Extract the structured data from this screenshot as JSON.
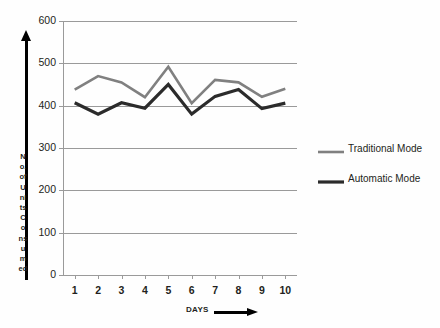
{
  "chart_data": {
    "type": "line",
    "title": "",
    "xlabel": "DAYS",
    "ylabel": "No. of Units Consumed",
    "ylabel_stack": [
      "N",
      "o.",
      "of",
      "U",
      "ni",
      "ts",
      "C",
      "o",
      "ns",
      "u",
      "m",
      "ed"
    ],
    "categories": [
      "1",
      "2",
      "3",
      "4",
      "5",
      "6",
      "7",
      "8",
      "9",
      "10"
    ],
    "x": [
      1,
      2,
      3,
      4,
      5,
      6,
      7,
      8,
      9,
      10
    ],
    "ylim": [
      0,
      600
    ],
    "yticks": [
      0,
      100,
      200,
      300,
      400,
      500,
      600
    ],
    "grid": true,
    "legend_position": "right",
    "series": [
      {
        "name": "Traditional Mode",
        "color": "#808080",
        "values": [
          438,
          470,
          455,
          420,
          492,
          406,
          461,
          455,
          421,
          440
        ]
      },
      {
        "name": "Automatic Mode",
        "color": "#2b2b2b",
        "values": [
          407,
          380,
          407,
          394,
          450,
          380,
          422,
          438,
          393,
          406
        ]
      }
    ]
  },
  "axes": {
    "y_arrow_icon": "up-arrow-icon",
    "x_arrow_icon": "right-arrow-icon",
    "gridline_color": "#9a9a9a"
  }
}
